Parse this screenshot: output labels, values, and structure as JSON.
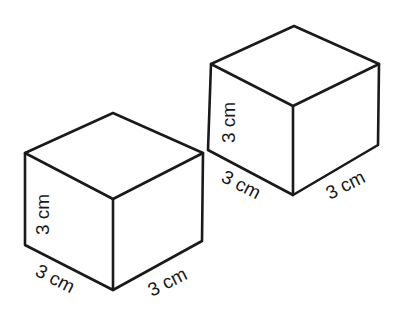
{
  "diagram": {
    "cubes": [
      {
        "id": "left-cube",
        "labels": {
          "height": "3 cm",
          "depth": "3 cm",
          "width": "3 cm"
        }
      },
      {
        "id": "right-cube",
        "labels": {
          "height": "3 cm",
          "depth": "3 cm",
          "width": "3 cm"
        }
      }
    ],
    "stroke_color": "#1a1a1a",
    "background": "#ffffff"
  }
}
